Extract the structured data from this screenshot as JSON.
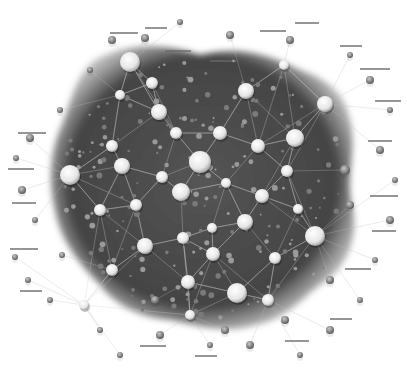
{
  "diagram": {
    "type": "network-graph",
    "style": "grayscale 3D spheres on dark textured cluster",
    "colors": {
      "background": "#ffffff",
      "cluster_fill": "#4a4a4a",
      "cluster_dark": "#3a3a3a",
      "edge": "#cfcfcf",
      "node_light": "#f2f2f2",
      "node_mid": "#9a9a9a",
      "node_dark": "#5a5a5a",
      "label": "#6a6a6a"
    },
    "labels_legible": false,
    "hubs": [
      {
        "x": 130,
        "y": 62,
        "r": 10
      },
      {
        "x": 200,
        "y": 162,
        "r": 11
      },
      {
        "x": 70,
        "y": 175,
        "r": 10
      },
      {
        "x": 315,
        "y": 236,
        "r": 10
      },
      {
        "x": 237,
        "y": 293,
        "r": 10
      },
      {
        "x": 159,
        "y": 112,
        "r": 8
      },
      {
        "x": 246,
        "y": 91,
        "r": 8
      },
      {
        "x": 295,
        "y": 138,
        "r": 9
      },
      {
        "x": 325,
        "y": 104,
        "r": 8
      },
      {
        "x": 122,
        "y": 166,
        "r": 8
      },
      {
        "x": 181,
        "y": 192,
        "r": 9
      },
      {
        "x": 145,
        "y": 246,
        "r": 8
      },
      {
        "x": 258,
        "y": 146,
        "r": 7
      },
      {
        "x": 245,
        "y": 222,
        "r": 8
      },
      {
        "x": 188,
        "y": 282,
        "r": 7
      },
      {
        "x": 220,
        "y": 133,
        "r": 7
      },
      {
        "x": 112,
        "y": 270,
        "r": 6
      },
      {
        "x": 213,
        "y": 254,
        "r": 7
      },
      {
        "x": 262,
        "y": 196,
        "r": 7
      },
      {
        "x": 100,
        "y": 210,
        "r": 6
      },
      {
        "x": 152,
        "y": 83,
        "r": 6
      },
      {
        "x": 183,
        "y": 238,
        "r": 6
      },
      {
        "x": 287,
        "y": 171,
        "r": 6
      },
      {
        "x": 275,
        "y": 258,
        "r": 6
      },
      {
        "x": 112,
        "y": 146,
        "r": 6
      },
      {
        "x": 176,
        "y": 133,
        "r": 6
      },
      {
        "x": 226,
        "y": 183,
        "r": 5
      },
      {
        "x": 162,
        "y": 177,
        "r": 6
      },
      {
        "x": 136,
        "y": 205,
        "r": 6
      },
      {
        "x": 212,
        "y": 228,
        "r": 5
      },
      {
        "x": 298,
        "y": 209,
        "r": 5
      },
      {
        "x": 268,
        "y": 300,
        "r": 6
      },
      {
        "x": 120,
        "y": 95,
        "r": 5
      },
      {
        "x": 284,
        "y": 65,
        "r": 5
      },
      {
        "x": 190,
        "y": 315,
        "r": 5
      },
      {
        "x": 84,
        "y": 305,
        "r": 5
      }
    ],
    "periphery_nodes": [
      {
        "x": 30,
        "y": 138,
        "r": 4
      },
      {
        "x": 16,
        "y": 158,
        "r": 3
      },
      {
        "x": 22,
        "y": 190,
        "r": 4
      },
      {
        "x": 35,
        "y": 220,
        "r": 3
      },
      {
        "x": 15,
        "y": 257,
        "r": 3
      },
      {
        "x": 28,
        "y": 280,
        "r": 3
      },
      {
        "x": 50,
        "y": 300,
        "r": 3
      },
      {
        "x": 112,
        "y": 40,
        "r": 4
      },
      {
        "x": 145,
        "y": 38,
        "r": 4
      },
      {
        "x": 180,
        "y": 22,
        "r": 3
      },
      {
        "x": 230,
        "y": 35,
        "r": 4
      },
      {
        "x": 290,
        "y": 40,
        "r": 4
      },
      {
        "x": 350,
        "y": 55,
        "r": 3
      },
      {
        "x": 370,
        "y": 80,
        "r": 4
      },
      {
        "x": 390,
        "y": 110,
        "r": 3
      },
      {
        "x": 380,
        "y": 150,
        "r": 4
      },
      {
        "x": 395,
        "y": 180,
        "r": 3
      },
      {
        "x": 390,
        "y": 220,
        "r": 4
      },
      {
        "x": 375,
        "y": 260,
        "r": 3
      },
      {
        "x": 360,
        "y": 300,
        "r": 3
      },
      {
        "x": 330,
        "y": 330,
        "r": 4
      },
      {
        "x": 300,
        "y": 355,
        "r": 3
      },
      {
        "x": 250,
        "y": 345,
        "r": 4
      },
      {
        "x": 210,
        "y": 345,
        "r": 3
      },
      {
        "x": 160,
        "y": 335,
        "r": 4
      },
      {
        "x": 120,
        "y": 355,
        "r": 3
      },
      {
        "x": 100,
        "y": 330,
        "r": 3
      },
      {
        "x": 62,
        "y": 255,
        "r": 3
      },
      {
        "x": 60,
        "y": 110,
        "r": 3
      },
      {
        "x": 90,
        "y": 70,
        "r": 3
      },
      {
        "x": 345,
        "y": 170,
        "r": 5
      },
      {
        "x": 350,
        "y": 205,
        "r": 4
      },
      {
        "x": 330,
        "y": 280,
        "r": 4
      },
      {
        "x": 285,
        "y": 320,
        "r": 4
      },
      {
        "x": 225,
        "y": 330,
        "r": 4
      },
      {
        "x": 155,
        "y": 300,
        "r": 4
      }
    ],
    "label_stubs": [
      {
        "x": 110,
        "y": 32,
        "w": 28
      },
      {
        "x": 145,
        "y": 27,
        "w": 22
      },
      {
        "x": 165,
        "y": 50,
        "w": 26
      },
      {
        "x": 295,
        "y": 22,
        "w": 24
      },
      {
        "x": 340,
        "y": 45,
        "w": 22
      },
      {
        "x": 360,
        "y": 68,
        "w": 30
      },
      {
        "x": 375,
        "y": 100,
        "w": 26
      },
      {
        "x": 368,
        "y": 140,
        "w": 24
      },
      {
        "x": 370,
        "y": 195,
        "w": 28
      },
      {
        "x": 372,
        "y": 230,
        "w": 24
      },
      {
        "x": 345,
        "y": 268,
        "w": 26
      },
      {
        "x": 330,
        "y": 318,
        "w": 22
      },
      {
        "x": 285,
        "y": 340,
        "w": 24
      },
      {
        "x": 195,
        "y": 355,
        "w": 22
      },
      {
        "x": 140,
        "y": 345,
        "w": 26
      },
      {
        "x": 18,
        "y": 132,
        "w": 28
      },
      {
        "x": 8,
        "y": 168,
        "w": 26
      },
      {
        "x": 12,
        "y": 202,
        "w": 24
      },
      {
        "x": 10,
        "y": 248,
        "w": 28
      },
      {
        "x": 20,
        "y": 290,
        "w": 22
      },
      {
        "x": 210,
        "y": 60,
        "w": 26
      },
      {
        "x": 260,
        "y": 30,
        "w": 26
      }
    ]
  }
}
